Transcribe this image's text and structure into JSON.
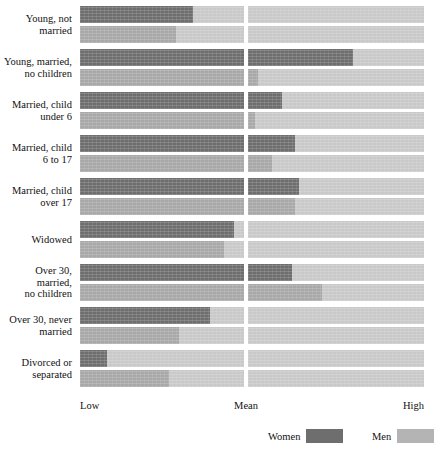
{
  "chart_data": {
    "type": "bar",
    "title": "",
    "subtitle": "",
    "xlabel": "",
    "ylabel": "",
    "orientation": "horizontal",
    "scale_note": "Each row is a horizontal track running from Low (left) to High (right) with a break at Mean. Values are the shaded (filled) extent measured as a 0-100 position along the Low-to-High axis.",
    "axis_ticks": [
      {
        "label": "Low",
        "position": 0
      },
      {
        "label": "Mean",
        "position": 48
      },
      {
        "label": "High",
        "position": 100
      }
    ],
    "xlim": [
      0,
      100
    ],
    "grid": false,
    "legend_position": "bottom-right",
    "legend": [
      {
        "name": "Women",
        "color": "#6e6e6e"
      },
      {
        "name": "Men",
        "color": "#b4b4b4"
      }
    ],
    "categories": [
      "Young, not married",
      "Young, married, no children",
      "Married, child under 6",
      "Married, child 6 to 17",
      "Married, child over 17",
      "Widowed",
      "Over 30, married, no children",
      "Over 30, never married",
      "Divorced or separated"
    ],
    "series": [
      {
        "name": "Women",
        "color": "#6e6e6e",
        "values": [
          33,
          79,
          58,
          62,
          63,
          45,
          61,
          38,
          8
        ]
      },
      {
        "name": "Men",
        "color": "#a8a8a8",
        "values": [
          28,
          51,
          50,
          55,
          62,
          42,
          70,
          29,
          26
        ]
      }
    ]
  },
  "rows": [
    {
      "label_lines": [
        "Young, not",
        "married"
      ],
      "women": 33,
      "men": 28
    },
    {
      "label_lines": [
        "Young, married,",
        "no children"
      ],
      "women": 79,
      "men": 51
    },
    {
      "label_lines": [
        "Married, child",
        "under 6"
      ],
      "women": 58,
      "men": 50
    },
    {
      "label_lines": [
        "Married, child",
        "6 to 17"
      ],
      "women": 62,
      "men": 55
    },
    {
      "label_lines": [
        "Married, child",
        "over 17"
      ],
      "women": 63,
      "men": 62
    },
    {
      "label_lines": [
        "Widowed"
      ],
      "women": 45,
      "men": 42
    },
    {
      "label_lines": [
        "Over 30,",
        "married,",
        "no children"
      ],
      "women": 61,
      "men": 70
    },
    {
      "label_lines": [
        "Over 30, never",
        "married"
      ],
      "women": 38,
      "men": 29
    },
    {
      "label_lines": [
        "Divorced or",
        "separated"
      ],
      "women": 8,
      "men": 26
    }
  ],
  "axis": {
    "low": "Low",
    "mean": "Mean",
    "high": "High"
  },
  "legend": {
    "women_label": "Women",
    "men_label": "Men"
  },
  "colors": {
    "women": "#6e6e6e",
    "men_fill": "#a8a8a8",
    "track": "#c9c9c9",
    "background": "#ffffff"
  }
}
